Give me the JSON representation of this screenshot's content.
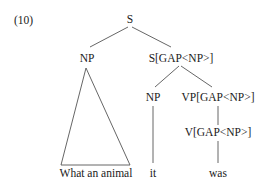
{
  "example_number": "(10)",
  "tree": {
    "root": "S",
    "left_child": "NP",
    "right_child": "S[GAP<NP>]",
    "right_np": "NP",
    "right_vp": "VP[GAP<NP>]",
    "verb": "V[GAP<NP>]",
    "leaves": {
      "triangle_phrase": "What an animal",
      "pronoun": "it",
      "verb_word": "was"
    }
  },
  "colors": {
    "line": "#555555",
    "text": "#1a1a1a",
    "background": "#ffffff"
  }
}
